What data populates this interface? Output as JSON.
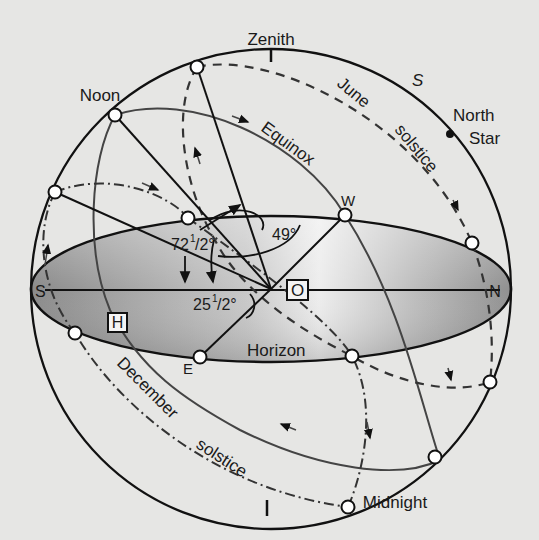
{
  "diagram": {
    "colors": {
      "background": "#e6e6e4",
      "line": "#111111",
      "path_gray": "#555555",
      "horizon_dark": "#8e8e8e",
      "horizon_light": "#f0f0f0"
    },
    "labels": {
      "zenith": "Zenith",
      "noon": "Noon",
      "midnight": "Midnight",
      "equinox": "Equinox",
      "june": "June",
      "june_solstice": "solstice",
      "december": "December",
      "december_solstice": "solstice",
      "north_star_1": "North",
      "north_star_2": "Star",
      "s_italic": "S",
      "horizon": "Horizon",
      "south": "S",
      "north": "N",
      "east": "E",
      "west": "W",
      "observer_box": "O",
      "horizon_box": "H",
      "angle_72": "72",
      "angle_72_frac": "1",
      "angle_72_frac2": "/2°",
      "angle_49": "49°",
      "angle_25": "25",
      "angle_25_frac": "1",
      "angle_25_frac2": "/2°"
    }
  }
}
